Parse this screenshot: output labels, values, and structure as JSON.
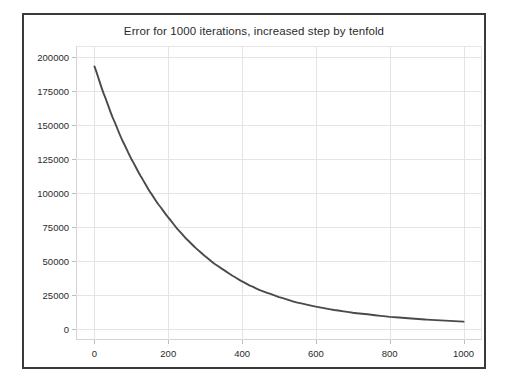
{
  "figure": {
    "title": "Error for 1000 iterations, increased step by tenfold",
    "background_color": "#ffffff",
    "frame_color": "#3a3a3a",
    "grid_color": "#e4e4e4",
    "line_color": "#4a4a4a"
  },
  "chart_data": {
    "type": "line",
    "title": "Error for 1000 iterations, increased step by tenfold",
    "xlabel": "",
    "ylabel": "",
    "xlim": [
      -50,
      1050
    ],
    "ylim": [
      -8000,
      208000
    ],
    "grid": true,
    "legend": null,
    "xticks": [
      0,
      200,
      400,
      600,
      800,
      1000
    ],
    "xticklabels": [
      "0",
      "200",
      "400",
      "600",
      "800",
      "1000"
    ],
    "yticks": [
      0,
      25000,
      50000,
      75000,
      100000,
      125000,
      150000,
      175000,
      200000
    ],
    "yticklabels": [
      "0",
      "25000",
      "50000",
      "75000",
      "100000",
      "125000",
      "150000",
      "175000",
      "200000"
    ],
    "series": [
      {
        "name": "error",
        "x": [
          0,
          25,
          50,
          75,
          100,
          125,
          150,
          175,
          200,
          225,
          250,
          275,
          300,
          325,
          350,
          375,
          400,
          425,
          450,
          475,
          500,
          550,
          600,
          650,
          700,
          750,
          800,
          850,
          900,
          950,
          1000
        ],
        "values": [
          193000,
          173000,
          155000,
          139000,
          125000,
          112500,
          101000,
          91000,
          82000,
          73500,
          66000,
          59500,
          53500,
          48000,
          43500,
          39000,
          35000,
          31500,
          28500,
          26000,
          23500,
          19500,
          16500,
          14000,
          12000,
          10500,
          9000,
          8000,
          7000,
          6200,
          5500
        ]
      }
    ]
  }
}
